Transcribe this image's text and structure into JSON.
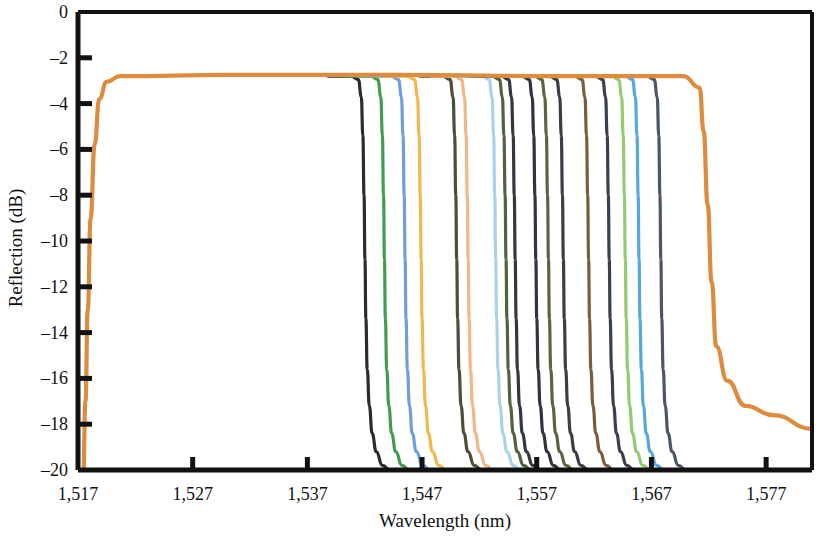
{
  "chart_data": {
    "type": "line",
    "title": "",
    "xlabel": "Wavelength (nm)",
    "ylabel": "Reflection (dB)",
    "xlim": [
      1517,
      1581
    ],
    "ylim": [
      -20,
      0
    ],
    "xticks": [
      1517,
      1527,
      1537,
      1547,
      1557,
      1567,
      1577
    ],
    "xtick_labels": [
      "1,517",
      "1,527",
      "1,537",
      "1,547",
      "1,557",
      "1,567",
      "1,577"
    ],
    "yticks": [
      0,
      -2,
      -4,
      -6,
      -8,
      -10,
      -12,
      -14,
      -16,
      -18,
      -20
    ],
    "ytick_labels": [
      "0",
      "–2",
      "–4",
      "–6",
      "–8",
      "–10",
      "–12",
      "–14",
      "–16",
      "–18",
      "–20"
    ],
    "grid": false,
    "legend": "none",
    "plateau_level_db": -2.8,
    "envelope": {
      "name": "broadband-envelope",
      "color": "#dd8c3e",
      "rise_start_nm": 1517.6,
      "rise_end_nm": 1519.5,
      "fall_start_nm": 1571.2,
      "fall_end_nm": 1573.6,
      "tail_end_db": -18.2,
      "plateau_db": -2.8
    },
    "series": [
      {
        "name": "channel-01",
        "color": "#2b2b2b",
        "edge_nm": 1542.0,
        "plateau_db": -2.8
      },
      {
        "name": "channel-02",
        "color": "#3f9e4d",
        "edge_nm": 1543.7,
        "plateau_db": -2.8
      },
      {
        "name": "channel-03",
        "color": "#6e9ede",
        "edge_nm": 1545.5,
        "plateau_db": -2.8
      },
      {
        "name": "channel-04",
        "color": "#f0b council",
        "edge_nm": 1546.9,
        "plateau_db": -2.8
      },
      {
        "name": "channel-05",
        "color": "#4a4e3a",
        "edge_nm": 1550.0,
        "plateau_db": -2.8
      },
      {
        "name": "channel-06",
        "color": "#f0b787",
        "edge_nm": 1551.0,
        "plateau_db": -2.8
      },
      {
        "name": "channel-07",
        "color": "#a9d2ea",
        "edge_nm": 1553.4,
        "plateau_db": -2.8
      },
      {
        "name": "channel-08",
        "color": "#51633a",
        "edge_nm": 1554.3,
        "plateau_db": -2.8
      },
      {
        "name": "channel-09",
        "color": "#33373f",
        "edge_nm": 1555.1,
        "plateau_db": -2.8
      },
      {
        "name": "channel-10",
        "color": "#2e3540",
        "edge_nm": 1556.9,
        "plateau_db": -2.8
      },
      {
        "name": "channel-11",
        "color": "#5e6440",
        "edge_nm": 1558.0,
        "plateau_db": -2.8
      },
      {
        "name": "channel-12",
        "color": "#3a3f47",
        "edge_nm": 1559.3,
        "plateau_db": -2.8
      },
      {
        "name": "channel-13",
        "color": "#7a5c3e",
        "edge_nm": 1561.5,
        "plateau_db": -2.8
      },
      {
        "name": "channel-14",
        "color": "#39414f",
        "edge_nm": 1563.3,
        "plateau_db": -2.8
      },
      {
        "name": "channel-15",
        "color": "#93cb72",
        "edge_nm": 1564.7,
        "plateau_db": -2.8
      },
      {
        "name": "channel-16",
        "color": "#55a8dd",
        "edge_nm": 1565.9,
        "plateau_db": -2.8
      },
      {
        "name": "channel-17",
        "color": "#4d5668",
        "edge_nm": 1567.8,
        "plateau_db": -2.8
      }
    ]
  },
  "axes": {
    "x_axis_title": "Wavelength (nm)",
    "y_axis_title": "Reflection (dB)"
  }
}
